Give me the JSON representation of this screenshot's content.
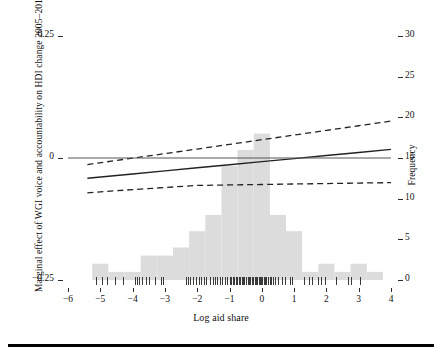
{
  "chart_data": {
    "type": "line",
    "title": "",
    "xlabel": "Log aid share",
    "ylabel": "Marginal effect of WGI voice and accountability on HDI change 2005–2012",
    "ylabel_right": "Frequency",
    "xlim": [
      -6,
      4
    ],
    "ylim": [
      -0.25,
      0.25
    ],
    "ylim_right": [
      0,
      30
    ],
    "grid": false,
    "legend": "none",
    "xticks": [
      "−6",
      "−5",
      "−4",
      "−3",
      "−2",
      "−1",
      "0",
      "1",
      "2",
      "3",
      "4"
    ],
    "xtick_values": [
      -6,
      -5,
      -4,
      -3,
      -2,
      -1,
      0,
      1,
      2,
      3,
      4
    ],
    "yticks_left": [
      "0.25",
      "0",
      "−0.25"
    ],
    "ytick_values_left": [
      0.25,
      0,
      -0.25
    ],
    "yticks_right": [
      "30",
      "25",
      "20",
      "15",
      "10",
      "5",
      "0"
    ],
    "ytick_values_right": [
      30,
      25,
      20,
      15,
      10,
      5,
      0
    ],
    "series": [
      {
        "name": "marginal effect",
        "style": "solid",
        "color": "#222222",
        "x": [
          -5.4,
          -4.0,
          -3.0,
          -2.0,
          -1.0,
          0.0,
          1.0,
          2.0,
          3.0,
          4.0
        ],
        "y": [
          -0.0415,
          -0.0327,
          -0.0264,
          -0.0201,
          -0.0138,
          -0.0075,
          -0.0012,
          0.0051,
          0.0114,
          0.0177
        ]
      },
      {
        "name": "upper 95% confidence bound",
        "style": "dashed",
        "color": "#222222",
        "x": [
          -5.4,
          -4.0,
          -3.0,
          -2.0,
          -1.0,
          0.0,
          1.0,
          2.0,
          3.0,
          4.0
        ],
        "y": [
          -0.0134,
          -0.0003,
          0.0089,
          0.0184,
          0.0279,
          0.0375,
          0.047,
          0.0566,
          0.0661,
          0.0757
        ]
      },
      {
        "name": "lower 95% confidence bound",
        "style": "dashed",
        "color": "#222222",
        "x": [
          -5.4,
          -4.0,
          -3.0,
          -2.0,
          -1.0,
          0.0,
          1.0,
          2.0,
          3.0,
          4.0
        ],
        "y": [
          -0.0713,
          -0.0648,
          -0.0605,
          -0.0562,
          -0.0552,
          -0.0543,
          -0.0533,
          -0.0524,
          -0.0514,
          -0.0505
        ]
      },
      {
        "name": "zero reference line",
        "style": "solid-thin",
        "color": "#555555",
        "x": [
          -6,
          4
        ],
        "y": [
          0,
          0
        ]
      }
    ],
    "histogram": {
      "name": "frequency of log aid share",
      "color": "#dcdcdc",
      "bin_width": 0.5,
      "bin_starts": [
        -5.25,
        -4.75,
        -4.25,
        -3.75,
        -3.25,
        -2.75,
        -2.25,
        -1.75,
        -1.25,
        -0.75,
        -0.25,
        0.25,
        0.75,
        1.25,
        1.75,
        2.25,
        2.75,
        3.25
      ],
      "counts": [
        2,
        1,
        1,
        3,
        3,
        4,
        6,
        8,
        14,
        16,
        18,
        8,
        6,
        1,
        2,
        1,
        2,
        1
      ]
    },
    "rug": {
      "name": "data rug marks",
      "values": [
        -5.12,
        -4.95,
        -4.78,
        -4.55,
        -4.3,
        -3.93,
        -3.86,
        -3.79,
        -3.7,
        -3.58,
        -3.5,
        -3.3,
        -3.12,
        -3.05,
        -2.35,
        -2.3,
        -2.22,
        -2.12,
        -2.05,
        -1.95,
        -1.88,
        -1.8,
        -1.72,
        -1.6,
        -1.52,
        -1.45,
        -1.38,
        -1.3,
        -1.22,
        -1.15,
        -1.08,
        -1.0,
        -0.95,
        -0.9,
        -0.85,
        -0.8,
        -0.76,
        -0.72,
        -0.68,
        -0.62,
        -0.58,
        -0.54,
        -0.48,
        -0.44,
        -0.4,
        -0.35,
        -0.3,
        -0.26,
        -0.22,
        -0.18,
        -0.14,
        -0.1,
        -0.06,
        -0.02,
        0.02,
        0.06,
        0.1,
        0.14,
        0.18,
        0.24,
        0.3,
        0.36,
        0.42,
        0.5,
        0.62,
        0.72,
        0.86,
        0.95,
        1.3,
        1.45,
        1.55,
        1.75,
        1.82,
        1.95,
        2.3,
        2.68,
        2.76,
        3.05
      ]
    }
  },
  "figure": {
    "background": "#ffffff",
    "hist_color": "#dcdcdc",
    "line_color": "#222222",
    "rule_color": "#000000"
  }
}
